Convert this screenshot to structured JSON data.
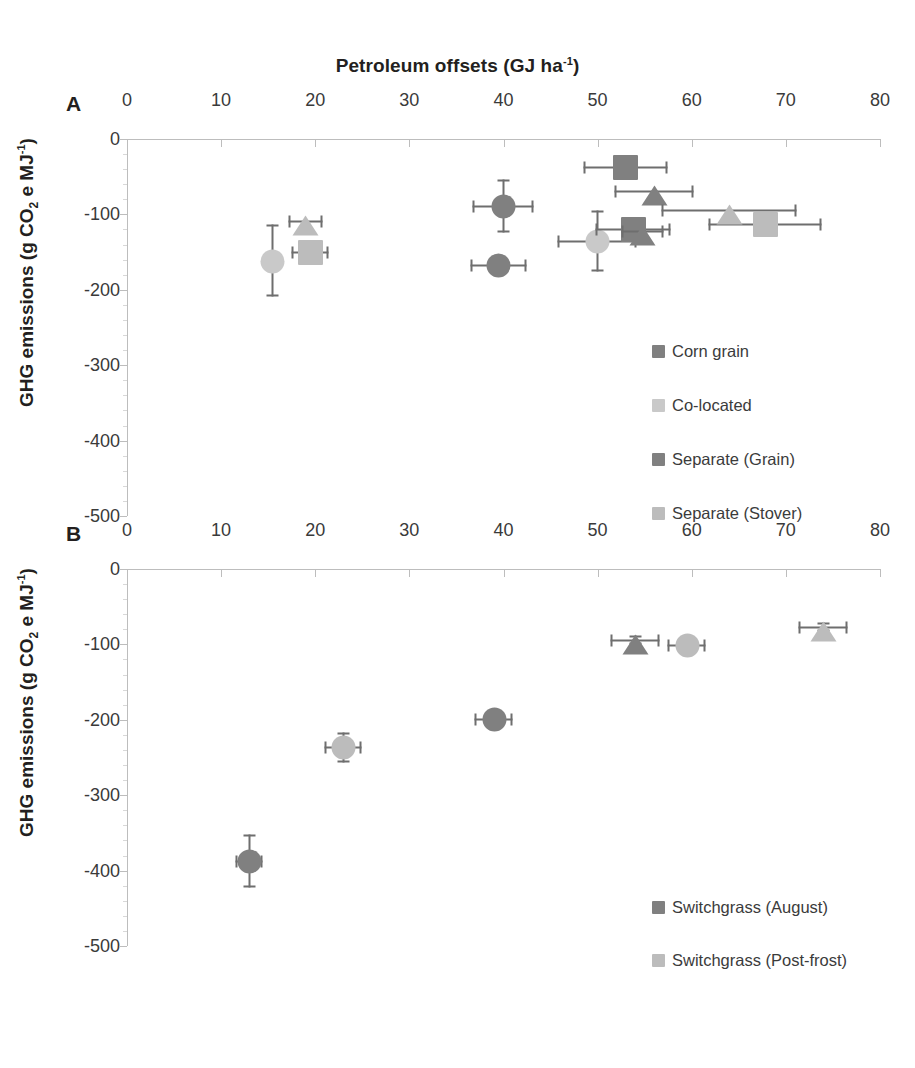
{
  "figure": {
    "title": "Petroleum offsets (GJ ha-1)",
    "title_main": "Petroleum offsets (GJ ha",
    "title_sup": "-1",
    "title_close": ")",
    "ylabel_main": "GHG emissions (g CO",
    "ylabel_sub": "2",
    "ylabel_mid": " e MJ",
    "ylabel_sup": "-1",
    "ylabel_close": ")"
  },
  "panels": {
    "a": {
      "label": "A"
    },
    "b": {
      "label": "B"
    }
  },
  "colors": {
    "dark_gray": "#808080",
    "mid_gray": "#949494",
    "light_gray": "#bcbcbc",
    "pale_gray": "#c9c9c9",
    "error_bar": "#6e6e6e",
    "axis": "#bdbdbd",
    "text": "#3a3a3a"
  },
  "chart_data": [
    {
      "type": "scatter",
      "panel": "A",
      "title": "Petroleum offsets (GJ ha-1)",
      "xlabel": "Petroleum offsets (GJ ha-1)",
      "ylabel": "GHG emissions (g CO2 e MJ-1)",
      "xlim": [
        0,
        80
      ],
      "ylim": [
        -500,
        0
      ],
      "xticks": [
        0,
        10,
        20,
        30,
        40,
        50,
        60,
        70,
        80
      ],
      "yticks": [
        0,
        -100,
        -200,
        -300,
        -400,
        -500
      ],
      "grid": false,
      "legend_position": "inside-right",
      "series": [
        {
          "name": "Corn grain",
          "color": "#808080",
          "marker": "circle",
          "points": [
            {
              "x": 40.0,
              "y": -90,
              "xerr": 3.2,
              "yerr": 35
            },
            {
              "x": 39.5,
              "y": -168,
              "xerr": 3.0,
              "yerr": 6
            }
          ]
        },
        {
          "name": "Co-located",
          "color": "#c9c9c9",
          "marker": "circle",
          "points": [
            {
              "x": 15.5,
              "y": -162,
              "xerr": 0,
              "yerr": 48
            },
            {
              "x": 50.0,
              "y": -136,
              "xerr": 4.2,
              "yerr": 40
            }
          ]
        },
        {
          "name": "Separate (Grain)",
          "color": "#808080",
          "marker": "square",
          "points": [
            {
              "x": 53.0,
              "y": -38,
              "xerr": 4.5,
              "yerr": 0
            },
            {
              "x": 53.8,
              "y": -120,
              "xerr": 4.0,
              "yerr": 0
            }
          ]
        },
        {
          "name": "Separate (Stover)",
          "color": "#bcbcbc",
          "marker": "square",
          "points": [
            {
              "x": 19.5,
              "y": -150,
              "xerr": 2.0,
              "yerr": 0
            },
            {
              "x": 67.8,
              "y": -114,
              "xerr": 6.0,
              "yerr": 0
            }
          ]
        },
        {
          "name": "Separate (Grain) triangle",
          "color": "#808080",
          "marker": "triangle",
          "points": [
            {
              "x": 56.0,
              "y": -70,
              "xerr": 4.2,
              "yerr": 0
            },
            {
              "x": 54.8,
              "y": -123,
              "xerr": 2.2,
              "yerr": 0
            }
          ]
        },
        {
          "name": "Separate (Stover) triangle",
          "color": "#bcbcbc",
          "marker": "triangle",
          "points": [
            {
              "x": 19.0,
              "y": -110,
              "xerr": 1.8,
              "yerr": 0
            },
            {
              "x": 64.0,
              "y": -95,
              "xerr": 7.2,
              "yerr": 0
            }
          ]
        }
      ]
    },
    {
      "type": "scatter",
      "panel": "B",
      "title": "",
      "xlabel": "Petroleum offsets (GJ ha-1)",
      "ylabel": "GHG emissions (g CO2 e MJ-1)",
      "xlim": [
        0,
        80
      ],
      "ylim": [
        -500,
        0
      ],
      "xticks": [
        0,
        10,
        20,
        30,
        40,
        50,
        60,
        70,
        80
      ],
      "yticks": [
        0,
        -100,
        -200,
        -300,
        -400,
        -500
      ],
      "grid": false,
      "legend_position": "inside-right",
      "series": [
        {
          "name": "Switchgrass (August)",
          "color": "#808080",
          "marker": "circle",
          "points": [
            {
              "x": 13.0,
              "y": -388,
              "xerr": 1.4,
              "yerr": 35
            },
            {
              "x": 39.0,
              "y": -200,
              "xerr": 2.0,
              "yerr": 10
            }
          ]
        },
        {
          "name": "Switchgrass (August) triangle",
          "color": "#808080",
          "marker": "triangle",
          "points": [
            {
              "x": 54.0,
              "y": -95,
              "xerr": 2.6,
              "yerr": 6
            }
          ]
        },
        {
          "name": "Switchgrass (Post-frost)",
          "color": "#bcbcbc",
          "marker": "circle",
          "points": [
            {
              "x": 23.0,
              "y": -237,
              "xerr": 2.0,
              "yerr": 20
            },
            {
              "x": 59.5,
              "y": -101,
              "xerr": 2.0,
              "yerr": 0
            }
          ]
        },
        {
          "name": "Switchgrass (Post-frost) triangle",
          "color": "#bcbcbc",
          "marker": "triangle",
          "points": [
            {
              "x": 74.0,
              "y": -77,
              "xerr": 2.6,
              "yerr": 6
            }
          ]
        }
      ]
    }
  ],
  "legends": {
    "a": [
      {
        "label": "Corn grain",
        "color": "#808080"
      },
      {
        "label": "Co-located",
        "color": "#c9c9c9"
      },
      {
        "label": "Separate (Grain)",
        "color": "#808080"
      },
      {
        "label": "Separate (Stover)",
        "color": "#bcbcbc"
      }
    ],
    "b": [
      {
        "label": "Switchgrass (August)",
        "color": "#808080"
      },
      {
        "label": "Switchgrass (Post-frost)",
        "color": "#bcbcbc"
      }
    ]
  },
  "axis_labels": {
    "x": [
      "0",
      "10",
      "20",
      "30",
      "40",
      "50",
      "60",
      "70",
      "80"
    ],
    "y": [
      "0",
      "-100",
      "-200",
      "-300",
      "-400",
      "-500"
    ]
  }
}
